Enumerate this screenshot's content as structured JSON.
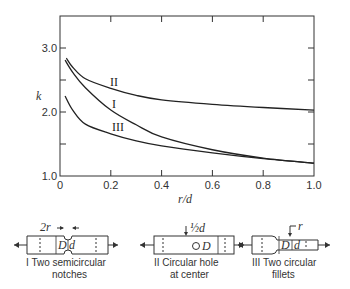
{
  "chart_data": {
    "type": "line",
    "title": "",
    "xlabel": "r/d",
    "ylabel": "k",
    "xlim": [
      0,
      1.0
    ],
    "ylim": [
      1.0,
      3.5
    ],
    "x_ticks": [
      "0",
      "0.2",
      "0.4",
      "0.6",
      "0.8",
      "1.0"
    ],
    "y_ticks": [
      "1.0",
      "2.0",
      "3.0"
    ],
    "grid": false,
    "series": [
      {
        "name": "II",
        "x": [
          0.025,
          0.05,
          0.1,
          0.2,
          0.3,
          0.4,
          0.6,
          0.8,
          1.0
        ],
        "values": [
          2.84,
          2.7,
          2.52,
          2.37,
          2.26,
          2.19,
          2.12,
          2.07,
          2.03
        ]
      },
      {
        "name": "I",
        "x": [
          0.02,
          0.05,
          0.1,
          0.2,
          0.3,
          0.4,
          0.6,
          0.8,
          1.0
        ],
        "values": [
          2.81,
          2.62,
          2.38,
          2.03,
          1.8,
          1.61,
          1.41,
          1.28,
          1.2
        ]
      },
      {
        "name": "III",
        "x": [
          0.02,
          0.05,
          0.1,
          0.2,
          0.3,
          0.4,
          0.6,
          0.8,
          1.0
        ],
        "values": [
          2.25,
          2.03,
          1.81,
          1.66,
          1.55,
          1.47,
          1.36,
          1.27,
          1.2
        ]
      }
    ],
    "annotations": [
      "II",
      "I",
      "III"
    ]
  },
  "axes": {
    "xlabel": "r/d",
    "ylabel": "k"
  },
  "diagrams": [
    {
      "id": "I",
      "caption_line1": "I  Two semicircular",
      "caption_line2": "notches",
      "dim_top": "2r",
      "label_D": "D",
      "label_d": "d"
    },
    {
      "id": "II",
      "caption_line1": "II  Circular hole",
      "caption_line2": "at center",
      "dim_top": "½d",
      "label_D": "D"
    },
    {
      "id": "III",
      "caption_line1": "III  Two circular",
      "caption_line2": "fillets",
      "dim_top": "r",
      "label_D": "D",
      "label_d": "d"
    }
  ]
}
